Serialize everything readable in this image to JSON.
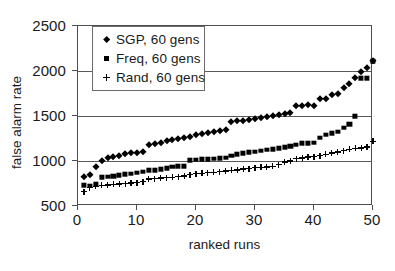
{
  "chart_data": {
    "type": "scatter",
    "title": "",
    "xlabel": "ranked runs",
    "ylabel": "false alarm rate",
    "xlim": [
      0,
      50
    ],
    "ylim": [
      500,
      2500
    ],
    "xticks": [
      0,
      10,
      20,
      30,
      40,
      50
    ],
    "yticks": [
      500,
      1000,
      1500,
      2000,
      2500
    ],
    "grid": "horizontal",
    "legend_position": "upper-left-inside",
    "x": [
      1,
      2,
      3,
      4,
      5,
      6,
      7,
      8,
      9,
      10,
      11,
      12,
      13,
      14,
      15,
      16,
      17,
      18,
      19,
      20,
      21,
      22,
      23,
      24,
      25,
      26,
      27,
      28,
      29,
      30,
      31,
      32,
      33,
      34,
      35,
      36,
      37,
      38,
      39,
      40,
      41,
      42,
      43,
      44,
      45,
      46,
      47,
      48,
      49,
      50
    ],
    "series": [
      {
        "name": "SGP, 60 gens",
        "marker": "diamond",
        "color": "#000000",
        "values": [
          820,
          845,
          930,
          1000,
          1030,
          1045,
          1060,
          1075,
          1085,
          1090,
          1100,
          1175,
          1190,
          1205,
          1220,
          1235,
          1245,
          1255,
          1270,
          1285,
          1300,
          1315,
          1325,
          1330,
          1340,
          1430,
          1440,
          1450,
          1455,
          1470,
          1480,
          1485,
          1495,
          1510,
          1520,
          1530,
          1610,
          1615,
          1620,
          1615,
          1685,
          1690,
          1730,
          1740,
          1810,
          1860,
          1925,
          1990,
          2030,
          2110
        ]
      },
      {
        "name": "Freq, 60 gens",
        "marker": "square",
        "color": "#000000",
        "values": [
          730,
          725,
          740,
          820,
          825,
          830,
          845,
          855,
          860,
          870,
          880,
          895,
          900,
          910,
          920,
          935,
          945,
          945,
          1010,
          1015,
          1020,
          1020,
          1025,
          1030,
          1035,
          1060,
          1075,
          1085,
          1095,
          1105,
          1115,
          1125,
          1130,
          1140,
          1155,
          1165,
          1180,
          1195,
          1200,
          1205,
          1260,
          1290,
          1310,
          1325,
          1370,
          1410,
          1500,
          1920,
          1920,
          2110
        ]
      },
      {
        "name": "Rand, 60 gens",
        "marker": "plus",
        "color": "#000000",
        "values": [
          660,
          705,
          720,
          730,
          735,
          740,
          745,
          750,
          755,
          760,
          770,
          800,
          805,
          810,
          815,
          820,
          825,
          835,
          850,
          860,
          865,
          870,
          875,
          880,
          890,
          895,
          900,
          910,
          915,
          925,
          930,
          935,
          940,
          960,
          990,
          1000,
          1025,
          1035,
          1045,
          1050,
          1060,
          1075,
          1090,
          1100,
          1115,
          1130,
          1140,
          1145,
          1155,
          1220
        ]
      }
    ]
  },
  "legend": {
    "items": [
      {
        "label": "SGP, 60 gens",
        "marker": "diamond"
      },
      {
        "label": "Freq, 60 gens",
        "marker": "square"
      },
      {
        "label": "Rand, 60 gens",
        "marker": "plus"
      }
    ]
  },
  "axes": {
    "y_title": "false alarm rate",
    "x_title": "ranked runs",
    "y_tick_labels": [
      "500",
      "1000",
      "1500",
      "2000",
      "2500"
    ],
    "x_tick_labels": [
      "0",
      "10",
      "20",
      "30",
      "40",
      "50"
    ]
  }
}
